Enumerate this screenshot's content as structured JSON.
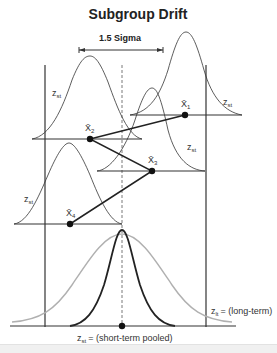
{
  "title": "Subgroup Drift",
  "shift_label": "1.5 Sigma",
  "curve_labels": {
    "zst_main": "z",
    "zst_sub": "st"
  },
  "subgroups": [
    {
      "name": "X̄",
      "index": "1",
      "cx": 185,
      "cy": 115
    },
    {
      "name": "X̄",
      "index": "2",
      "cx": 90,
      "cy": 139
    },
    {
      "name": "X̄",
      "index": "3",
      "cx": 152,
      "cy": 171
    },
    {
      "name": "X̄",
      "index": "4",
      "cx": 70,
      "cy": 224
    }
  ],
  "long_term_label": {
    "z": "z",
    "sub": "lt",
    "text": "= (long-term)"
  },
  "short_term_pooled_label": {
    "z": "z",
    "sub": "st",
    "text": "= (short-term pooled)"
  },
  "colors": {
    "line": "#333333",
    "light_curve": "#b0b0b0",
    "dot": "#111111"
  }
}
